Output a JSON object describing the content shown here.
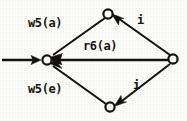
{
  "diagram": {
    "type": "directed-graph",
    "title": "",
    "background_color": "#fdfdfb",
    "ink_color": "#141210",
    "nodes": [
      {
        "id": "left",
        "label": "",
        "shape": "circle",
        "x": 47,
        "y": 60,
        "r": 4.6
      },
      {
        "id": "top",
        "label": "",
        "shape": "circle",
        "x": 108,
        "y": 14,
        "r": 4.6
      },
      {
        "id": "right",
        "label": "",
        "shape": "circle",
        "x": 173,
        "y": 59,
        "r": 4.6
      },
      {
        "id": "bottom",
        "label": "",
        "shape": "circle",
        "x": 110,
        "y": 107,
        "r": 4.6
      }
    ],
    "edges": [
      {
        "id": "edge-entry",
        "from": "margin-left",
        "to": "left",
        "label": "",
        "direction": "rightward"
      },
      {
        "id": "edge-top-left",
        "from": "top",
        "to": "left",
        "label": "w5(a)",
        "direction": "down-left"
      },
      {
        "id": "edge-right-left",
        "from": "right",
        "to": "left",
        "label": "r6(a)",
        "direction": "leftward"
      },
      {
        "id": "edge-bottom-left",
        "from": "bottom",
        "to": "left",
        "label": "w5(e)",
        "direction": "up-left"
      },
      {
        "id": "edge-right-top",
        "from": "right",
        "to": "top",
        "label": "i",
        "direction": "up-left"
      },
      {
        "id": "edge-right-bottom",
        "from": "right",
        "to": "bottom",
        "label": "i",
        "direction": "down-left"
      }
    ],
    "labels": {
      "w5a": "w5(a)",
      "r6a": "r6(a)",
      "w5e": "w5(e)",
      "i_top": "i",
      "i_bottom": "i"
    }
  }
}
